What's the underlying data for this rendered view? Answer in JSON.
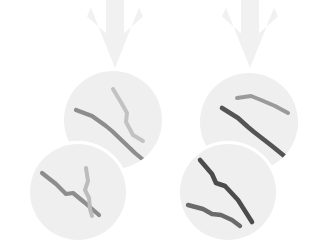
{
  "diagram": {
    "title": "Cell division diagram with chromosomes",
    "canvas": {
      "width": 331,
      "height": 244,
      "background": "#ffffff"
    },
    "palette": {
      "background": "#ffffff",
      "arrow_fill": "#f1f1f1",
      "cell_fill": "#eeefee",
      "cell_outline": "#ffffff",
      "chromosome_dark": "#4c4c4c",
      "chromosome_mid": "#8d8d8d",
      "chromosome_light": "#bfbfbf"
    },
    "arrows": [
      {
        "name": "left-division-arrow",
        "label": "Left division arrow",
        "direction": "down",
        "x": 115,
        "y_start": 0,
        "y_end": 68,
        "shaft_width": 18,
        "head_width": 56,
        "color": "#f1f1f1"
      },
      {
        "name": "right-division-arrow",
        "label": "Right division arrow",
        "direction": "down",
        "x": 250,
        "y_start": 0,
        "y_end": 68,
        "shaft_width": 18,
        "head_width": 56,
        "color": "#f1f1f1"
      }
    ],
    "cells": [
      {
        "name": "cell-upper-left",
        "label": "Upper left daughter cell",
        "cx": 113,
        "cy": 120,
        "r": 49,
        "fill": "#eeefee",
        "ring": false,
        "chromosomes": [
          {
            "name": "chromosome-ul-a",
            "label": "Chromosome A",
            "color": "#8d8d8d",
            "thickness": 4.2,
            "points": "76,110 92,116 106,126 112,131 135,153 147,163"
          },
          {
            "name": "chromosome-ul-b",
            "label": "Chromosome B",
            "color": "#c2c2c2",
            "thickness": 4.0,
            "points": "113,89 122,104 127,113 126,122 133,135 143,141"
          }
        ]
      },
      {
        "name": "cell-lower-left",
        "label": "Lower left daughter cell",
        "cx": 78,
        "cy": 192,
        "r": 48,
        "fill": "#eeefee",
        "ring": true,
        "chromosomes": [
          {
            "name": "chromosome-ll-a",
            "label": "Chromosome A",
            "color": "#8d8d8d",
            "thickness": 4.2,
            "points": "42,173 56,184 66,194 73,193 84,202 99,215"
          },
          {
            "name": "chromosome-ll-b",
            "label": "Chromosome B",
            "color": "#bcbcbc",
            "thickness": 4.0,
            "points": "86,168 88,181 85,190 89,198 90,209 92,216"
          }
        ]
      },
      {
        "name": "cell-upper-right",
        "label": "Upper right daughter cell",
        "cx": 249,
        "cy": 122,
        "r": 49,
        "fill": "#eeefee",
        "ring": false,
        "chromosomes": [
          {
            "name": "chromosome-ur-a",
            "label": "Chromosome A",
            "color": "#9a9a9a",
            "thickness": 4.0,
            "points": "237,98 251,96 261,100 275,106 288,113"
          },
          {
            "name": "chromosome-ur-b",
            "label": "Chromosome B",
            "color": "#545454",
            "thickness": 4.6,
            "points": "222,108 238,118 248,127 254,132 272,146 288,159"
          }
        ]
      },
      {
        "name": "cell-lower-right",
        "label": "Lower right daughter cell",
        "cx": 228,
        "cy": 192,
        "r": 48,
        "fill": "#eeefee",
        "ring": true,
        "chromosomes": [
          {
            "name": "chromosome-lr-a",
            "label": "Chromosome A",
            "color": "#4c4c4c",
            "thickness": 4.6,
            "points": "200,160 212,174 216,183 225,186 238,200 252,222"
          },
          {
            "name": "chromosome-lr-b",
            "label": "Chromosome B",
            "color": "#6a6a6a",
            "thickness": 4.4,
            "points": "188,205 203,209 212,214 221,215 232,220 240,226"
          }
        ]
      }
    ]
  }
}
